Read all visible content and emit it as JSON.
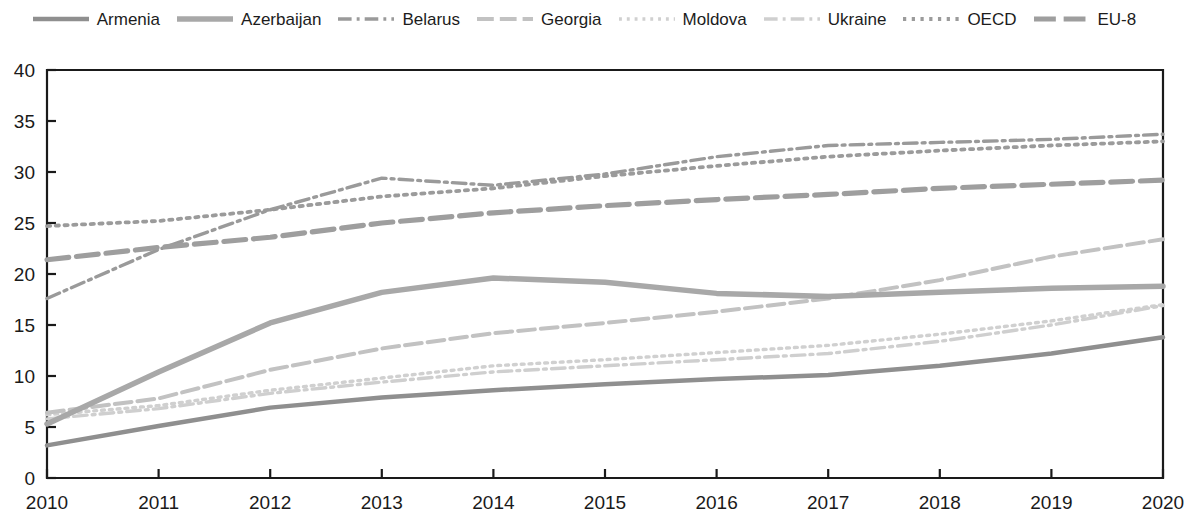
{
  "chart_data": {
    "type": "line",
    "title": "",
    "subtitle": "",
    "xlabel": "",
    "ylabel": "",
    "grid": false,
    "legend_position": "top",
    "x": [
      2010,
      2011,
      2012,
      2013,
      2014,
      2015,
      2016,
      2017,
      2018,
      2019,
      2020
    ],
    "xtick_labels": [
      "2010",
      "2011",
      "2012",
      "2013",
      "2014",
      "2015",
      "2016",
      "2017",
      "2018",
      "2019",
      "2020"
    ],
    "ytick_labels": [
      "0",
      "5",
      "10",
      "15",
      "20",
      "25",
      "30",
      "35",
      "40"
    ],
    "yticks": [
      0,
      5,
      10,
      15,
      20,
      25,
      30,
      35,
      40
    ],
    "ylim": [
      0,
      40
    ],
    "xlim": [
      2010,
      2020
    ],
    "series": [
      {
        "name": "Armenia",
        "style": "solid",
        "color": "#8f8f8f",
        "width": 4.5,
        "values": [
          3.2,
          5.1,
          6.9,
          7.9,
          8.6,
          9.2,
          9.7,
          10.1,
          11.0,
          12.2,
          13.8
        ]
      },
      {
        "name": "Azerbaijan",
        "style": "solid",
        "color": "#a8a8a8",
        "width": 5.5,
        "values": [
          5.3,
          10.4,
          15.2,
          18.2,
          19.6,
          19.2,
          18.1,
          17.8,
          18.2,
          18.6,
          18.8
        ]
      },
      {
        "name": "Belarus",
        "style": "dashdot",
        "color": "#9a9a9a",
        "width": 3.4,
        "values": [
          17.6,
          22.4,
          26.3,
          29.4,
          28.7,
          29.8,
          31.5,
          32.6,
          32.9,
          33.2,
          33.7
        ]
      },
      {
        "name": "Georgia",
        "style": "dashed",
        "color": "#c2c2c2",
        "width": 4.0,
        "values": [
          6.4,
          7.8,
          10.6,
          12.7,
          14.2,
          15.2,
          16.3,
          17.6,
          19.4,
          21.7,
          23.4
        ]
      },
      {
        "name": "Moldova",
        "style": "dotted",
        "color": "#d0d0d0",
        "width": 3.4,
        "values": [
          6.2,
          7.1,
          8.6,
          9.8,
          11.0,
          11.6,
          12.3,
          13.0,
          14.1,
          15.4,
          17.0
        ]
      },
      {
        "name": "Ukraine",
        "style": "dashdot",
        "color": "#cfcfcf",
        "width": 3.4,
        "values": [
          5.8,
          6.8,
          8.3,
          9.4,
          10.4,
          11.0,
          11.6,
          12.2,
          13.4,
          15.0,
          16.9
        ]
      },
      {
        "name": "OECD",
        "style": "dotted",
        "color": "#9b9b9b",
        "width": 3.8,
        "values": [
          24.7,
          25.2,
          26.3,
          27.6,
          28.4,
          29.6,
          30.6,
          31.5,
          32.1,
          32.6,
          33.0
        ]
      },
      {
        "name": "EU-8",
        "style": "dashed",
        "color": "#9e9e9e",
        "width": 5.2,
        "values": [
          21.4,
          22.6,
          23.6,
          25.0,
          26.0,
          26.7,
          27.3,
          27.8,
          28.4,
          28.8,
          29.2
        ]
      }
    ]
  },
  "legend": {
    "items": [
      {
        "label": "Armenia"
      },
      {
        "label": "Azerbaijan"
      },
      {
        "label": "Belarus"
      },
      {
        "label": "Georgia"
      },
      {
        "label": "Moldova"
      },
      {
        "label": "Ukraine"
      },
      {
        "label": "OECD"
      },
      {
        "label": "EU-8"
      }
    ]
  }
}
